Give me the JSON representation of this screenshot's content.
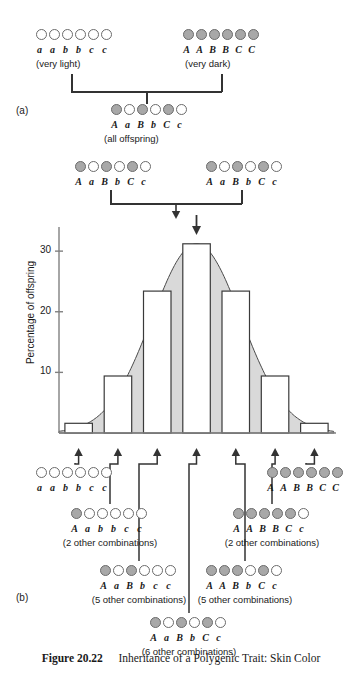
{
  "figure": {
    "number": "Figure 20.22",
    "title": "Inheritance of a Polygenic Trait: Skin Color"
  },
  "panels": [
    {
      "key": "a",
      "label": "(a)"
    },
    {
      "key": "b",
      "label": "(b)"
    }
  ],
  "colors": {
    "dominant_allele_fill": "#a8a8a8",
    "recessive_allele_fill": "#ffffff",
    "allele_stroke": "#6b6b6b",
    "curve_fill": "#d9d9d9",
    "curve_stroke": "#4a4a4a",
    "bar_fill": "#ffffff",
    "bar_stroke": "#3a3a3a",
    "axis": "#808080",
    "connector": "#333333"
  },
  "panel_a": {
    "parent_left": {
      "genotype": "a a b b c c",
      "alleles": [
        0,
        0,
        0,
        0,
        0,
        0
      ],
      "phenotype_note": "(very light)"
    },
    "parent_right": {
      "genotype": "A A B B C C",
      "alleles": [
        1,
        1,
        1,
        1,
        1,
        1
      ],
      "phenotype_note": "(very dark)"
    },
    "f1": {
      "genotype": "A a B b C c",
      "alleles": [
        1,
        0,
        1,
        0,
        1,
        0
      ],
      "phenotype_note": "(all offspring)"
    },
    "f1_cross_left": {
      "genotype": "A a B b C c",
      "alleles": [
        1,
        0,
        1,
        0,
        1,
        0
      ]
    },
    "f1_cross_right": {
      "genotype": "A a B b C c",
      "alleles": [
        1,
        0,
        1,
        0,
        1,
        0
      ]
    }
  },
  "chart_data": {
    "type": "bar",
    "title": "",
    "xlabel": "",
    "ylabel": "Percentage of offspring",
    "ylim": [
      0,
      32
    ],
    "yticks": [
      10,
      20,
      30
    ],
    "ytick_labels": [
      "10",
      "20",
      "30"
    ],
    "grid": false,
    "legend": null,
    "categories": [
      "0 dominant",
      "1 dominant",
      "2 dominant",
      "3 dominant",
      "4 dominant",
      "5 dominant",
      "6 dominant"
    ],
    "values": [
      1.6,
      9.4,
      23.4,
      31.2,
      23.4,
      9.4,
      1.6
    ],
    "overlay": {
      "type": "area",
      "name": "normal distribution curve",
      "peak_value": 31.2
    },
    "annotations": [
      {
        "name": "arrow-to-bar-1",
        "target_category": "0 dominant"
      },
      {
        "name": "arrow-to-bar-2",
        "target_category": "1 dominant"
      },
      {
        "name": "arrow-to-bar-3",
        "target_category": "2 dominant"
      },
      {
        "name": "arrow-to-bar-4",
        "target_category": "3 dominant"
      },
      {
        "name": "arrow-to-bar-5",
        "target_category": "4 dominant"
      },
      {
        "name": "arrow-to-bar-6",
        "target_category": "5 dominant"
      },
      {
        "name": "arrow-to-bar-7",
        "target_category": "6 dominant"
      }
    ]
  },
  "panel_b": {
    "genotypes": [
      {
        "key": "aabbcc",
        "genotype": "a a b b c c",
        "alleles": [
          0,
          0,
          0,
          0,
          0,
          0
        ],
        "note": ""
      },
      {
        "key": "AAbbcc",
        "genotype": "A a b b c c",
        "alleles": [
          1,
          0,
          0,
          0,
          0,
          0
        ],
        "note": "(2 other combinations)"
      },
      {
        "key": "AaBbcc",
        "genotype": "A a B b c c",
        "alleles": [
          1,
          0,
          1,
          0,
          0,
          0
        ],
        "note": "(5 other combinations)"
      },
      {
        "key": "AaBbCc",
        "genotype": "A a B b C c",
        "alleles": [
          1,
          0,
          1,
          0,
          1,
          0
        ],
        "note": "(6 other combinations)"
      },
      {
        "key": "AABbCc",
        "genotype": "A A B b C c",
        "alleles": [
          1,
          1,
          1,
          0,
          1,
          0
        ],
        "note": "(5 other combinations)"
      },
      {
        "key": "AABBCc",
        "genotype": "A A B B C c",
        "alleles": [
          1,
          1,
          1,
          1,
          1,
          0
        ],
        "note": "(2 other combinations)"
      },
      {
        "key": "AABBCC",
        "genotype": "A A B B C C",
        "alleles": [
          1,
          1,
          1,
          1,
          1,
          1
        ],
        "note": ""
      }
    ]
  }
}
